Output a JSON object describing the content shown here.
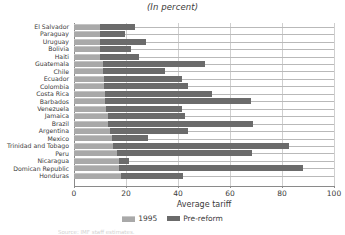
{
  "subtitle": "(In percent)",
  "axis": {
    "x_title": "Average tariff",
    "ticks": [
      "0",
      "20",
      "40",
      "60",
      "80",
      "100"
    ]
  },
  "legend": {
    "items": [
      {
        "label": "1995",
        "color": "#a9a9a9",
        "icon": "legend-swatch-icon"
      },
      {
        "label": "Pre-reform",
        "color": "#6b6b6b",
        "icon": "legend-swatch-icon"
      }
    ]
  },
  "footnote": "Source: IMF staff estimates.",
  "chart_data": {
    "type": "bar",
    "orientation": "horizontal",
    "stacked": true,
    "title": "",
    "subtitle": "(In percent)",
    "xlabel": "Average tariff",
    "ylabel": "",
    "xlim": [
      0,
      100
    ],
    "xticks": [
      0,
      20,
      40,
      60,
      80,
      100
    ],
    "grid": true,
    "legend_position": "bottom-center",
    "categories": [
      "El Salvador",
      "Paraguay",
      "Uruguay",
      "Bolivia",
      "Haiti",
      "Guatemala",
      "Chile",
      "Ecuador",
      "Colombia",
      "Costa Rica",
      "Barbados",
      "Venezuela",
      "Jamaica",
      "Brazil",
      "Argentina",
      "Mexico",
      "Trinidad and Tobago",
      "Peru",
      "Nicaragua",
      "Domican Republic",
      "Honduras"
    ],
    "series": [
      {
        "name": "1995",
        "color": "#a9a9a9",
        "values": [
          10,
          10,
          10,
          10,
          10,
          11,
          11,
          11.5,
          11.5,
          12,
          12,
          12.5,
          13,
          13,
          14,
          14.5,
          15,
          16.5,
          17.5,
          17.5,
          18
        ]
      },
      {
        "name": "Pre-reform",
        "color": "#6b6b6b",
        "values": [
          23.5,
          19.5,
          27.5,
          22,
          25,
          50.5,
          35,
          41.5,
          44,
          53,
          68,
          41.5,
          42.5,
          69,
          44,
          28.5,
          82.5,
          68.5,
          21,
          88,
          42
        ]
      }
    ]
  }
}
